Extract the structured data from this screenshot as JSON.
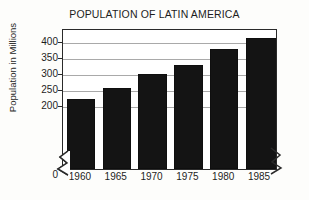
{
  "chart_data": {
    "type": "bar",
    "title": "POPULATION OF LATIN AMERICA",
    "xlabel": "",
    "ylabel": "Population in Millions",
    "categories": [
      "1960",
      "1965",
      "1970",
      "1975",
      "1980",
      "1985"
    ],
    "values": [
      219,
      254,
      297,
      326,
      375,
      408
    ],
    "ylim": [
      0,
      440
    ],
    "yticks": [
      "0",
      "200",
      "250",
      "300",
      "350",
      "400"
    ],
    "ytick_values": [
      0,
      200,
      250,
      300,
      350,
      400
    ],
    "gridlines": [
      200,
      250,
      300,
      350,
      400
    ],
    "grid": true,
    "legend": "none",
    "axis_break": "y-axis broken between 0 and 200",
    "bar_color": "#141414",
    "series": [
      {
        "name": "Population",
        "values": [
          219,
          254,
          297,
          326,
          375,
          408
        ]
      }
    ]
  },
  "figure": {
    "background_color": "#fdfdfb",
    "frame_color": "#2a2a2a",
    "gridline_color": "#a9a9a9",
    "text_color": "#1d1d1d"
  }
}
